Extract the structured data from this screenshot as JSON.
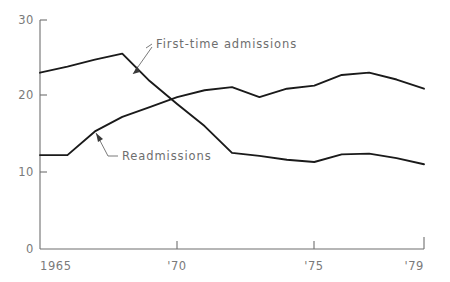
{
  "chart_data": {
    "type": "line",
    "title": "",
    "subtitle": "",
    "xlabel": "",
    "ylabel": "",
    "grid": false,
    "legend_position": "inline-annotations",
    "xlim": [
      1965,
      1979
    ],
    "ylim": [
      0,
      30
    ],
    "yticks": [
      0,
      10,
      20,
      30
    ],
    "ytick_labels": [
      "0",
      "10",
      "20",
      "30"
    ],
    "xticks": [
      1965,
      1970,
      1975,
      1979
    ],
    "xtick_labels": [
      "1965",
      "'70",
      "'75",
      "'79"
    ],
    "x": [
      1965,
      1966,
      1967,
      1968,
      1969,
      1970,
      1971,
      1972,
      1973,
      1974,
      1975,
      1976,
      1977,
      1978,
      1979
    ],
    "series": [
      {
        "name": "First-time admissions",
        "values": [
          23.1,
          23.9,
          24.8,
          25.6,
          22.0,
          19.0,
          16.1,
          12.6,
          12.2,
          11.7,
          11.4,
          12.4,
          12.5,
          11.9,
          11.1
        ]
      },
      {
        "name": "Readmissions",
        "values": [
          12.3,
          12.3,
          15.4,
          17.3,
          18.6,
          19.9,
          20.8,
          21.2,
          19.9,
          21.0,
          21.4,
          22.8,
          23.1,
          22.2,
          21.0
        ]
      }
    ],
    "annotations": [
      {
        "text": "First-time admissions",
        "target_series": "First-time admissions"
      },
      {
        "text": "Readmissions",
        "target_series": "Readmissions"
      }
    ],
    "colors": {
      "line": "#1a1a1a",
      "axis": "#6f6f6f",
      "text": "#7a7a7a",
      "background": "#ffffff"
    }
  },
  "axes": {
    "y_labels": {
      "t30": "30",
      "t20": "20",
      "t10": "10",
      "t0": "0"
    },
    "x_labels": {
      "x1965": "1965",
      "x1970": "'70",
      "x1975": "'75",
      "x1979": "'79"
    }
  },
  "labels": {
    "first_time": "First-time admissions",
    "readmissions": "Readmissions"
  }
}
